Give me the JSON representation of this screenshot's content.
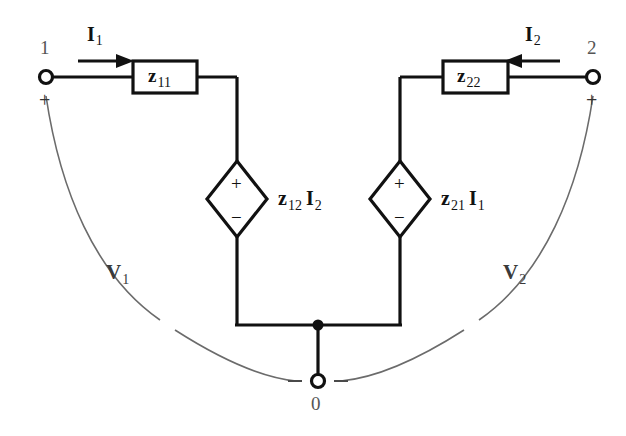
{
  "diagram": {
    "colors": {
      "wire": "#111111",
      "arc": "#6b6b6b",
      "text": "#111111",
      "node_num": "#555555",
      "background": "#ffffff"
    },
    "ports": [
      {
        "id": "port-1",
        "number": "1",
        "polarity_top": "+",
        "voltage_label": "V",
        "voltage_sub": "1",
        "current_label": "I",
        "current_sub": "1",
        "current_direction": "right"
      },
      {
        "id": "port-2",
        "number": "2",
        "polarity_top": "+",
        "voltage_label": "V",
        "voltage_sub": "2",
        "current_label": "I",
        "current_sub": "2",
        "current_direction": "left"
      }
    ],
    "impedance_boxes": [
      {
        "id": "z11-box",
        "symbol": "z",
        "subscript": "11"
      },
      {
        "id": "z22-box",
        "symbol": "z",
        "subscript": "22"
      }
    ],
    "dependent_sources": [
      {
        "id": "source-z12i2",
        "coefficient": "z",
        "coefficient_sub": "12",
        "current": "I",
        "current_sub": "2",
        "terminal_top": "+",
        "terminal_bottom": "−"
      },
      {
        "id": "source-z21i1",
        "coefficient": "z",
        "coefficient_sub": "21",
        "current": "I",
        "current_sub": "1",
        "terminal_top": "+",
        "terminal_bottom": "−"
      }
    ],
    "ground": {
      "id": "ground-node",
      "number": "0",
      "polarity_left": "–",
      "polarity_right": "–"
    }
  }
}
